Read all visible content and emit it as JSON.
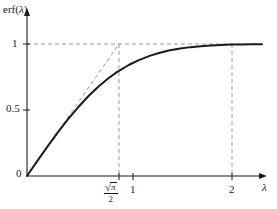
{
  "chart_data": {
    "type": "line",
    "title": "",
    "xlabel": "λ",
    "ylabel": "erf(λ)",
    "xlim": [
      0,
      2.3
    ],
    "ylim": [
      0,
      1.12
    ],
    "grid": false,
    "legend": null,
    "axis_labels": {
      "y_axis_label": "erf(λ)",
      "y_axis_label_prefix": "erf(",
      "y_axis_label_variable": "λ",
      "y_axis_label_suffix": ")",
      "x_axis_label": "λ"
    },
    "yticks": [
      0,
      0.5,
      1
    ],
    "ytick_labels": [
      "0",
      "0.5",
      "1"
    ],
    "xticks": [
      0.8862269255,
      1,
      2
    ],
    "xtick_labels": [
      "√π/2",
      "1",
      "2"
    ],
    "xtick_label_parts": {
      "sqrt_pi_over_2": {
        "radical_sign": "√",
        "numerator": "π",
        "denominator": "2"
      },
      "one": "1",
      "two": "2"
    },
    "series": [
      {
        "name": "erf(λ)",
        "style": "solid",
        "color": "#1a1a1a",
        "x": [
          0,
          0.1,
          0.2,
          0.3,
          0.4,
          0.5,
          0.6,
          0.7,
          0.8,
          0.8862,
          0.9,
          1.0,
          1.1,
          1.2,
          1.3,
          1.4,
          1.5,
          1.6,
          1.7,
          1.8,
          1.9,
          2.0,
          2.1,
          2.2,
          2.3
        ],
        "y": [
          0,
          0.1125,
          0.2227,
          0.3286,
          0.4284,
          0.5205,
          0.6039,
          0.6778,
          0.7421,
          0.7906,
          0.7969,
          0.8427,
          0.8802,
          0.9103,
          0.934,
          0.9523,
          0.9661,
          0.9763,
          0.9838,
          0.9891,
          0.9928,
          0.9953,
          0.997,
          0.9981,
          0.9989
        ]
      },
      {
        "name": "tangent at origin",
        "style": "dashed",
        "color": "#8a8a8a",
        "x": [
          0,
          0.8862269255
        ],
        "y": [
          0,
          1.0
        ]
      }
    ],
    "guide_lines": [
      {
        "name": "y-equals-one",
        "orientation": "horizontal",
        "value": 1,
        "style": "dashed",
        "from": 0,
        "to": 2.3
      },
      {
        "name": "x-equals-sqrt-pi-over-2",
        "orientation": "vertical",
        "value": 0.8862269255,
        "style": "dashed",
        "from": 0,
        "to": 1
      },
      {
        "name": "x-equals-two",
        "orientation": "vertical",
        "value": 2,
        "style": "dashed",
        "from": 0,
        "to": 1
      }
    ],
    "annotations": [
      {
        "name": "origin-label",
        "text": "0",
        "x": 0,
        "y": 0
      }
    ]
  },
  "colors": {
    "curve": "#1a1a1a",
    "axis": "#1a1a1a",
    "dashed": "#9a9a9a",
    "text": "#1a1a1a",
    "background": "#ffffff"
  }
}
